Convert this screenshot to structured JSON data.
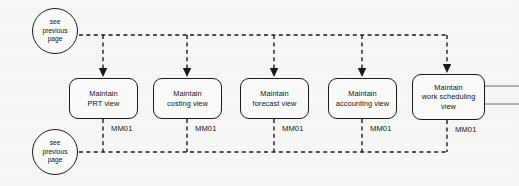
{
  "diagram": {
    "type": "flowchart",
    "background_color": "#f7f7f6",
    "line_color": "#1b1b1b",
    "connector_style": "dashed",
    "exit_line_color": "#9a9a9a",
    "page_refs": [
      {
        "id": "see-previous-page-top",
        "label": "see\nprevious\npage",
        "cx": 55,
        "cy": 31
      },
      {
        "id": "see-previous-page-bottom",
        "label": "see\nprevious\npage",
        "cx": 55,
        "cy": 152
      }
    ],
    "nodes": [
      {
        "id": "maintain-prt-view",
        "label": "Maintain\nPRT view",
        "transaction": "MM01",
        "x": 69,
        "y": 78,
        "w": 69,
        "h": 41,
        "connector_x": 103
      },
      {
        "id": "maintain-costing-view",
        "label": "Maintain\ncosting view",
        "transaction": "MM01",
        "x": 153,
        "y": 78,
        "w": 69,
        "h": 41,
        "connector_x": 187
      },
      {
        "id": "maintain-forecast-view",
        "label": "Maintain\nforecast view",
        "transaction": "MM01",
        "x": 240,
        "y": 78,
        "w": 69,
        "h": 41,
        "connector_x": 274
      },
      {
        "id": "maintain-accounting-view",
        "label": "Maintain\naccounting view",
        "transaction": "MM01",
        "x": 328,
        "y": 78,
        "w": 69,
        "h": 41,
        "connector_x": 362
      },
      {
        "id": "maintain-work-scheduling-view",
        "label": "Maintain\nwork scheduling\nview",
        "transaction": "MM01",
        "x": 412,
        "y": 74,
        "w": 73,
        "h": 46,
        "connector_x": 447
      }
    ],
    "rails": {
      "top_y": 35,
      "bottom_y": 152,
      "top_start_x": 79,
      "top_end_x": 447,
      "bottom_start_x": 79,
      "bottom_end_x": 447
    },
    "exit_lines": [
      {
        "id": "exit-line-upper",
        "x1": 485,
        "y1": 86,
        "x2": 519,
        "y2": 86
      },
      {
        "id": "exit-line-lower",
        "x1": 485,
        "y1": 104,
        "x2": 519,
        "y2": 104
      }
    ]
  }
}
